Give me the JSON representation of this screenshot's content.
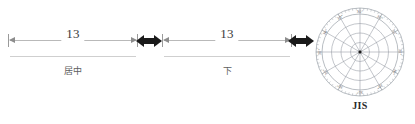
{
  "dimensions": [
    {
      "value": "13",
      "caption": "居中",
      "name": "dimension-centered"
    },
    {
      "value": "13",
      "caption": "下",
      "name": "dimension-below"
    }
  ],
  "separators": [
    {
      "icon": "double-arrow-horizontal-icon"
    },
    {
      "icon": "double-arrow-horizontal-icon"
    }
  ],
  "polar": {
    "caption": "JIS",
    "tick_labels": [
      "30°",
      "30°",
      "30°",
      "30°",
      "30°",
      "30°",
      "30°",
      "30°",
      "30°",
      "30°",
      "30°",
      "30°"
    ],
    "spoke_count": 12,
    "ring_count": 3,
    "line_color": "#9aa0a8",
    "center_color": "#1a1a1a"
  },
  "colors": {
    "background": "#ffffff",
    "dimension_line": "#b9b9b9",
    "baseline": "#cfcfcf",
    "value_text": "#3b3b3b",
    "caption_text": "#5e5e5e",
    "arrow": "#1a1a1a"
  }
}
